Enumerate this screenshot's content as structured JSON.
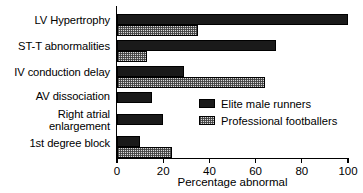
{
  "chart_data": {
    "type": "bar",
    "orientation": "horizontal",
    "title": "",
    "xlabel": "Percentage abnormal",
    "ylabel": "",
    "xlim": [
      0,
      100
    ],
    "xticks": [
      0,
      20,
      40,
      60,
      80,
      100
    ],
    "xtick_labels": [
      "0",
      "20",
      "40",
      "60",
      "80",
      "100"
    ],
    "grid": false,
    "legend_position": "center-right",
    "categories": [
      "LV Hypertrophy",
      "ST-T abnormalities",
      "IV conduction delay",
      "AV dissociation",
      "Right atrial\nenlargement",
      "1st degree block"
    ],
    "series": [
      {
        "name": "Elite male runners",
        "color": "#1a1a1a",
        "pattern": "solid",
        "values": [
          100,
          69,
          29,
          15,
          20,
          10
        ]
      },
      {
        "name": "Professional footballers",
        "color": "#d8d8d8",
        "pattern": "hatched",
        "values": [
          35,
          13,
          64,
          0,
          0,
          24
        ]
      }
    ]
  },
  "legend": {
    "items": [
      {
        "label": "Elite male runners"
      },
      {
        "label": "Professional footballers"
      }
    ]
  },
  "axis": {
    "x_title": "Percentage abnormal"
  }
}
